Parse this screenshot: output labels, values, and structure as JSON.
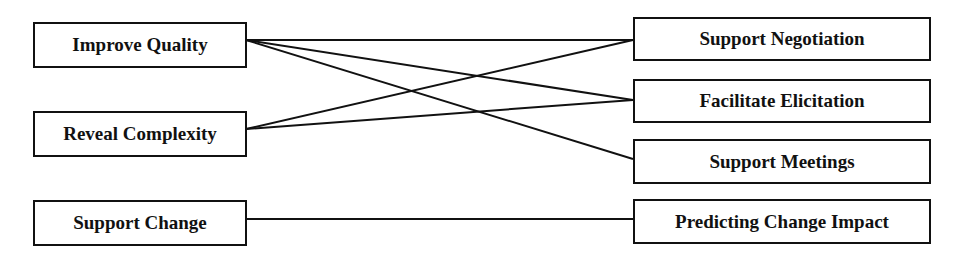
{
  "diagram": {
    "left_nodes": [
      {
        "id": "improve-quality",
        "label": "Improve Quality",
        "x": 33,
        "y": 22,
        "w": 214,
        "h": 46
      },
      {
        "id": "reveal-complexity",
        "label": "Reveal Complexity",
        "x": 33,
        "y": 111,
        "w": 214,
        "h": 46
      },
      {
        "id": "support-change",
        "label": "Support Change",
        "x": 33,
        "y": 200,
        "w": 214,
        "h": 46
      }
    ],
    "right_nodes": [
      {
        "id": "support-negotiation",
        "label": "Support Negotiation",
        "x": 633,
        "y": 17,
        "w": 298,
        "h": 44
      },
      {
        "id": "facilitate-elicitation",
        "label": "Facilitate Elicitation",
        "x": 633,
        "y": 79,
        "w": 298,
        "h": 44
      },
      {
        "id": "support-meetings",
        "label": "Support Meetings",
        "x": 633,
        "y": 139,
        "w": 298,
        "h": 45
      },
      {
        "id": "predicting-change-impact",
        "label": "Predicting Change Impact",
        "x": 633,
        "y": 199,
        "w": 298,
        "h": 45
      }
    ],
    "edges": [
      {
        "from": "improve-quality",
        "to": "support-negotiation",
        "x1": 246,
        "y1": 40,
        "x2": 633,
        "y2": 40
      },
      {
        "from": "improve-quality",
        "to": "facilitate-elicitation",
        "x1": 246,
        "y1": 40,
        "x2": 633,
        "y2": 100
      },
      {
        "from": "improve-quality",
        "to": "support-meetings",
        "x1": 246,
        "y1": 40,
        "x2": 633,
        "y2": 159
      },
      {
        "from": "reveal-complexity",
        "to": "support-negotiation",
        "x1": 246,
        "y1": 129,
        "x2": 633,
        "y2": 40
      },
      {
        "from": "reveal-complexity",
        "to": "facilitate-elicitation",
        "x1": 246,
        "y1": 129,
        "x2": 633,
        "y2": 100
      },
      {
        "from": "support-change",
        "to": "predicting-change-impact",
        "x1": 246,
        "y1": 219,
        "x2": 633,
        "y2": 219
      }
    ],
    "colors": {
      "stroke": "#111111",
      "background": "#ffffff",
      "text": "#111111"
    }
  }
}
